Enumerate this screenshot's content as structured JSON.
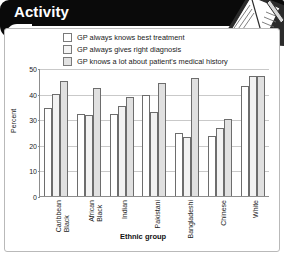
{
  "banner": {
    "title": "Activity"
  },
  "decoration": {
    "icon": "notebook-and-pencil-icon"
  },
  "legend": {
    "items": [
      {
        "label": "GP always knows best treatment",
        "swatch": "#ffffff"
      },
      {
        "label": "GP always gives right diagnosis",
        "swatch": "#f4f4f4"
      },
      {
        "label": "GP knows a lot about patient's medical history",
        "swatch": "#e2e2e2"
      }
    ]
  },
  "chart_data": {
    "type": "bar",
    "title": "",
    "xlabel": "Ethnic group",
    "ylabel": "Percent",
    "ylim": [
      0,
      50
    ],
    "yticks": [
      0,
      10,
      20,
      30,
      40,
      50
    ],
    "grid": true,
    "legend_position": "top",
    "categories": [
      "Black Caribbean",
      "Black African",
      "Indian",
      "Pakistani",
      "Bangladeshi",
      "Chinese",
      "White"
    ],
    "category_lines": [
      [
        "Black",
        "Caribbean"
      ],
      [
        "Black",
        "African"
      ],
      [
        "Indian"
      ],
      [
        "Pakistani"
      ],
      [
        "Bangladeshi"
      ],
      [
        "Chinese"
      ],
      [
        "White"
      ]
    ],
    "series": [
      {
        "name": "GP always knows best treatment",
        "values": [
          34.5,
          32.0,
          32.0,
          39.5,
          24.5,
          23.5,
          43.0
        ]
      },
      {
        "name": "GP always gives right diagnosis",
        "values": [
          40.0,
          31.5,
          35.0,
          33.0,
          23.0,
          26.5,
          47.0
        ]
      },
      {
        "name": "GP knows a lot about patient's medical history",
        "values": [
          45.0,
          42.0,
          38.5,
          44.0,
          46.0,
          30.0,
          47.0
        ]
      }
    ]
  }
}
